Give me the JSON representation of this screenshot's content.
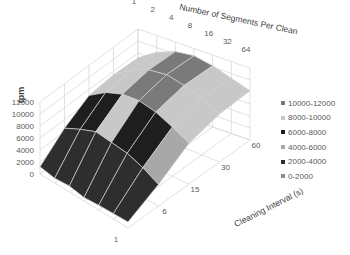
{
  "chart_data": {
    "type": "surface",
    "title": "",
    "ylabel": "tpm",
    "x_axis_title": "Number of Segments Per Clean",
    "x_categories": [
      "1",
      "2",
      "4",
      "8",
      "16",
      "32",
      "64"
    ],
    "z_axis_title": "Cleaning Interval (s)",
    "z_categories": [
      "1",
      "6",
      "15",
      "30",
      "60"
    ],
    "y_ticks": [
      "0",
      "2000",
      "4000",
      "6000",
      "8000",
      "10000",
      "12000"
    ],
    "ylim": [
      0,
      12000
    ],
    "legend": [
      {
        "label": "10000-12000",
        "color": "#7a7a7a"
      },
      {
        "label": "8000-10000",
        "color": "#c8c8c8"
      },
      {
        "label": "6000-8000",
        "color": "#1e1e1e"
      },
      {
        "label": "4000-6000",
        "color": "#a8a8a8"
      },
      {
        "label": "2000-4000",
        "color": "#2e2e2e"
      },
      {
        "label": "0-2000",
        "color": "#8c8c8c"
      }
    ],
    "series_note": "rows = cleaning interval (back 60 to front 1), columns = segments per clean (1..64)",
    "values": [
      [
        7200,
        9200,
        10400,
        10800,
        10200,
        9200,
        8200
      ],
      [
        7400,
        9400,
        10600,
        11000,
        10400,
        9400,
        8000
      ],
      [
        7000,
        8800,
        9800,
        10000,
        9400,
        8200,
        6800
      ],
      [
        4600,
        5800,
        6800,
        6400,
        6000,
        5000,
        3600
      ],
      [
        1200,
        800,
        1000,
        600,
        800,
        900,
        1000
      ]
    ]
  }
}
